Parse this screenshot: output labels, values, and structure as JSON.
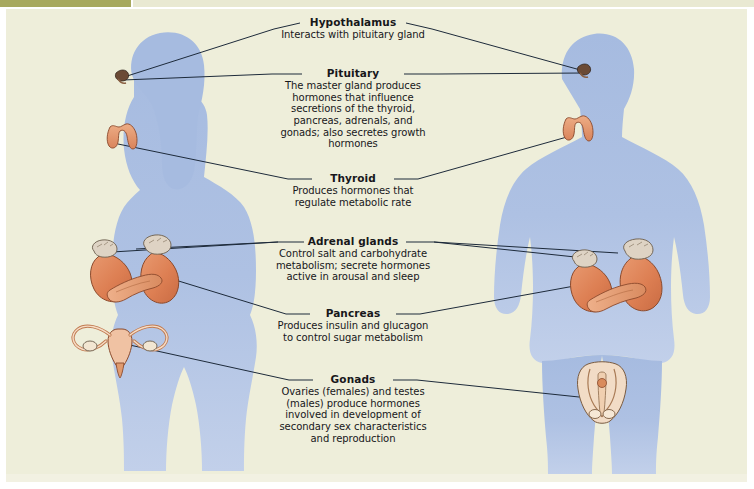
{
  "diagram": {
    "background_color": "#eeeeda",
    "body_color": "#a9bde1",
    "organ_color": "#e0855c",
    "line_color": "#1d2a3a",
    "text_color": "#17171a"
  },
  "figures": [
    {
      "name": "female-figure",
      "side": "left",
      "description": "female body silhouette with long hair"
    },
    {
      "name": "male-figure",
      "side": "right",
      "description": "male body silhouette"
    }
  ],
  "labels": [
    {
      "id": "hypothalamus",
      "title": "Hypothalamus",
      "description": "Interacts with pituitary gland"
    },
    {
      "id": "pituitary",
      "title": "Pituitary",
      "description": "The master gland produces\nhormones that influence\nsecretions of the thyroid,\npancreas, adrenals, and\ngonads; also secretes growth\nhormones"
    },
    {
      "id": "thyroid",
      "title": "Thyroid",
      "description": "Produces hormones that\nregulate metabolic rate"
    },
    {
      "id": "adrenal-glands",
      "title": "Adrenal glands",
      "description": "Control salt and carbohydrate\nmetabolism; secrete hormones\nactive in arousal and sleep"
    },
    {
      "id": "pancreas",
      "title": "Pancreas",
      "description": "Produces insulin and glucagon\nto control sugar metabolism"
    },
    {
      "id": "gonads",
      "title": "Gonads",
      "description": "Ovaries (females) and testes\n(males) produce hormones\ninvolved in development of\nsecondary sex characteristics\nand reproduction"
    }
  ],
  "organs": [
    {
      "id": "pituitary-female",
      "name": "pituitary-gland",
      "side": "left"
    },
    {
      "id": "pituitary-male",
      "name": "pituitary-gland",
      "side": "right"
    },
    {
      "id": "thyroid-female",
      "name": "thyroid-gland",
      "side": "left"
    },
    {
      "id": "thyroid-male",
      "name": "thyroid-gland",
      "side": "right"
    },
    {
      "id": "adrenals-female",
      "name": "kidneys-with-adrenal-glands-and-pancreas",
      "side": "left"
    },
    {
      "id": "adrenals-male",
      "name": "kidneys-with-adrenal-glands-and-pancreas",
      "side": "right"
    },
    {
      "id": "ovaries-female",
      "name": "uterus-and-ovaries",
      "side": "left"
    },
    {
      "id": "testes-male",
      "name": "testes",
      "side": "right"
    }
  ]
}
